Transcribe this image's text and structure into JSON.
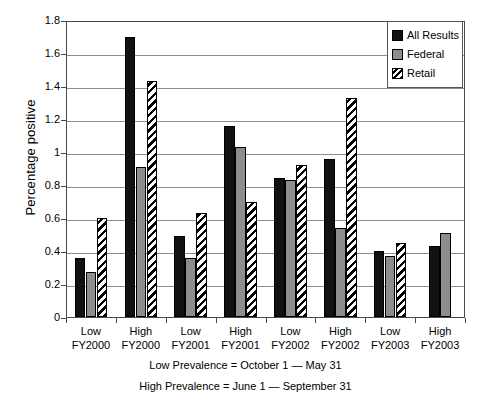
{
  "chart_data": {
    "type": "bar",
    "title": "",
    "xlabel": "",
    "ylabel": "Percentage positive",
    "ylim": [
      0,
      1.8
    ],
    "ytick_labels": [
      "1.8",
      "1.6",
      "1.4",
      "1.2",
      "1",
      "0.8",
      "0.6",
      "0.4",
      "0.2",
      "0"
    ],
    "ytick_values": [
      1.8,
      1.6,
      1.4,
      1.2,
      1.0,
      0.8,
      0.6,
      0.4,
      0.2,
      0
    ],
    "grid": "horizontal",
    "legend_position": "top-right",
    "categories": [
      "Low FY2000",
      "High FY2000",
      "Low FY2001",
      "High FY2001",
      "Low FY2002",
      "High FY2002",
      "Low FY2003",
      "High FY2003"
    ],
    "category_lines": [
      [
        "Low",
        "FY2000"
      ],
      [
        "High",
        "FY2000"
      ],
      [
        "Low",
        "FY2001"
      ],
      [
        "High",
        "FY2001"
      ],
      [
        "Low",
        "FY2002"
      ],
      [
        "High",
        "FY2002"
      ],
      [
        "Low",
        "FY2003"
      ],
      [
        "High",
        "FY2003"
      ]
    ],
    "series": [
      {
        "name": "All Results",
        "color": "#111111",
        "pattern": "solid-black",
        "values": [
          0.36,
          1.7,
          0.49,
          1.16,
          0.84,
          0.96,
          0.4,
          0.43
        ]
      },
      {
        "name": "Federal",
        "color": "#8d8d8d",
        "pattern": "solid-gray",
        "values": [
          0.27,
          0.91,
          0.36,
          1.03,
          0.83,
          0.54,
          0.37,
          0.51
        ]
      },
      {
        "name": "Retail",
        "color": "#000000",
        "pattern": "diagonal-hatch",
        "values": [
          0.6,
          1.43,
          0.63,
          0.7,
          0.92,
          1.33,
          0.45,
          null
        ]
      }
    ],
    "annotations": [
      "Low Prevalence = October 1 — May 31",
      "High Prevalence = June 1 — September 31"
    ]
  },
  "legend": {
    "items": [
      {
        "label": "All Results"
      },
      {
        "label": "Federal"
      },
      {
        "label": "Retail"
      }
    ]
  },
  "footnotes": {
    "low_prevalence": "Low Prevalence = October 1 — May 31",
    "high_prevalence": "High Prevalence = June 1 — September 31"
  }
}
